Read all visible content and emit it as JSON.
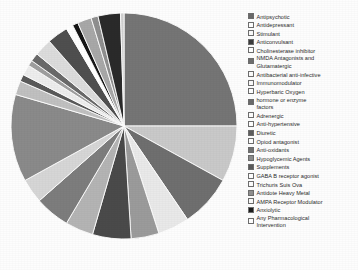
{
  "chart_data": {
    "type": "pie",
    "title": "",
    "subtitle": "",
    "xlabel": "",
    "ylabel": "",
    "grid": false,
    "legend_position": "right",
    "start_angle_deg": -90,
    "direction": "clockwise",
    "categories": [
      "Antipsychotic",
      "Antidepressant",
      "Stimulant",
      "Anticonvulsant",
      "Cholinesterase inhibitor",
      "NMDA Antagonists and Glutamatergic",
      "Antibacterial anti-infective",
      "Immunomodulator",
      "Hyperbaric Oxygen",
      "hormone or enzyme factors",
      "Adrenergic",
      "Anti-hypertensive",
      "Diuretic",
      "Opiod antagonist",
      "Anti-oxidants",
      "Hypoglycemic Agents",
      "Supplements",
      "GABA B receptor agonist",
      "Trichuris Suis Ova",
      "Antidote Heavy Metal",
      "AMPA Receptor Modulator",
      "Anxiolytic",
      "Any Pharmacological Intervention"
    ],
    "values": [
      25.0,
      8.0,
      7.5,
      4.5,
      4.0,
      5.5,
      4.0,
      5.0,
      3.5,
      12.5,
      2.0,
      1.0,
      1.5,
      0.8,
      1.2,
      2.5,
      3.0,
      1.0,
      0.8,
      2.0,
      1.0,
      3.2,
      0.5
    ],
    "colors": [
      "#757575",
      "#c9c9c9",
      "#6f6f6f",
      "#e9e9e9",
      "#9b9b9b",
      "#4a4a4a",
      "#b4b4b4",
      "#7d7d7d",
      "#d6d6d6",
      "#8a8a8a",
      "#c0c0c0",
      "#5a5a5a",
      "#ededed",
      "#9f9f9f",
      "#6a6a6a",
      "#dcdcdc",
      "#4f4f4f",
      "#ffffff",
      "#161616",
      "#a8a8a8",
      "#8f8f8f",
      "#2a2a2a",
      "#cfcfcf"
    ]
  },
  "legend": {
    "items": [
      {
        "label": "Antipsychotic",
        "swatch": "#6a6a6a",
        "lines": 1
      },
      {
        "label": "Antidepressant",
        "swatch": "#ffffff",
        "lines": 1
      },
      {
        "label": "Stimulant",
        "swatch": "#fbfbfb",
        "lines": 1
      },
      {
        "label": "Anticonvulsant",
        "swatch": "#3c3c3c",
        "lines": 1
      },
      {
        "label": "Cholinesterase inhibitor",
        "swatch": "#ffffff",
        "lines": 1
      },
      {
        "label": "NMDA Antagonists and\nGlutamatergic",
        "swatch": "#6f6f6f",
        "lines": 2
      },
      {
        "label": "Antibacterial anti-infective",
        "swatch": "#fcfcfc",
        "lines": 1
      },
      {
        "label": "Immunomodulator",
        "swatch": "#fbfbfb",
        "lines": 1
      },
      {
        "label": "Hyperbaric Oxygen",
        "swatch": "#ffffff",
        "lines": 1
      },
      {
        "label": "hormone or enzyme\nfactors",
        "swatch": "#6b6b6b",
        "lines": 2
      },
      {
        "label": "Adrenergic",
        "swatch": "#fdfdfd",
        "lines": 1
      },
      {
        "label": "Anti-hypertensive",
        "swatch": "#ffffff",
        "lines": 1
      },
      {
        "label": "Diuretic",
        "swatch": "#5e5e5e",
        "lines": 1
      },
      {
        "label": "Opiod antagonist",
        "swatch": "#ffffff",
        "lines": 1
      },
      {
        "label": "Anti-oxidants",
        "swatch": "#707070",
        "lines": 1
      },
      {
        "label": "Hypoglycemic Agents",
        "swatch": "#8c8c8c",
        "lines": 1
      },
      {
        "label": "Supplements",
        "swatch": "#5a5a5a",
        "lines": 1
      },
      {
        "label": "GABA B receptor agonist",
        "swatch": "#ffffff",
        "lines": 1
      },
      {
        "label": "Trichuris Suis Ova",
        "swatch": "#fdfdfd",
        "lines": 1
      },
      {
        "label": "Antidote Heavy Metal",
        "swatch": "#8f8f8f",
        "lines": 1
      },
      {
        "label": "AMPA Receptor Modulator",
        "swatch": "#fbfbfb",
        "lines": 1
      },
      {
        "label": "Anxiolytic",
        "swatch": "#1d1d1d",
        "lines": 1
      },
      {
        "label": "Any Pharmacological\nIntervention",
        "swatch": "#ffffff",
        "lines": 2
      }
    ]
  }
}
